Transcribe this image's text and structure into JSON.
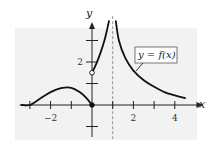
{
  "chart_data": {
    "type": "line",
    "title": "",
    "xlabel": "x",
    "ylabel": "y",
    "xlim": [
      -3.4,
      4.9
    ],
    "ylim": [
      -1.4,
      3.9
    ],
    "x_ticks": [
      -3,
      -2,
      -1,
      1,
      2,
      3,
      4
    ],
    "x_tick_labels": [
      {
        "value": -2,
        "label": "−2"
      },
      {
        "value": 2,
        "label": "2"
      },
      {
        "value": 4,
        "label": "4"
      }
    ],
    "y_ticks": [
      -1,
      1,
      2,
      3
    ],
    "y_tick_labels": [
      {
        "value": 2,
        "label": "2"
      }
    ],
    "grid": false,
    "legend": {
      "text": "y = f(x)",
      "placement": "top-right"
    },
    "asymptote": {
      "x": 1,
      "style": "dashed"
    },
    "series": [
      {
        "name": "left-branch",
        "points": [
          [
            -3.4,
            0
          ],
          [
            -3,
            0
          ],
          [
            -2.5,
            0.3
          ],
          [
            -2,
            0.6
          ],
          [
            -1.5,
            0.78
          ],
          [
            -1,
            0.8
          ],
          [
            -0.6,
            0.6
          ],
          [
            -0.3,
            0.35
          ],
          [
            0,
            0
          ]
        ]
      },
      {
        "name": "middle-branch",
        "points": [
          [
            0,
            1.5
          ],
          [
            0.2,
            1.9
          ],
          [
            0.4,
            2.4
          ],
          [
            0.6,
            3.0
          ],
          [
            0.75,
            3.6
          ],
          [
            0.82,
            3.9
          ]
        ]
      },
      {
        "name": "right-branch",
        "points": [
          [
            1.15,
            3.9
          ],
          [
            1.3,
            3.0
          ],
          [
            1.6,
            2.2
          ],
          [
            2,
            1.6
          ],
          [
            2.5,
            1.15
          ],
          [
            3,
            0.85
          ],
          [
            3.5,
            0.6
          ],
          [
            4,
            0.45
          ],
          [
            4.5,
            0.32
          ]
        ]
      }
    ],
    "points": [
      {
        "x": 0,
        "y": 1.5,
        "style": "open"
      },
      {
        "x": 0,
        "y": 0,
        "style": "filled"
      }
    ]
  }
}
